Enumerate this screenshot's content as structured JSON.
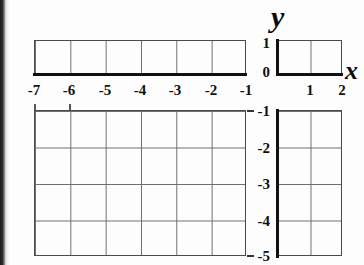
{
  "figure": {
    "kind": "coordinate-grid"
  },
  "axes": {
    "x_name": "x",
    "y_name": "y"
  },
  "chart_data": {
    "type": "scatter",
    "title": "",
    "subtitle": "",
    "xlabel": "x",
    "ylabel": "y",
    "xlim": [
      -7,
      2
    ],
    "ylim": [
      -5,
      1
    ],
    "xticks": [
      -7,
      -6,
      -5,
      -4,
      -3,
      -2,
      -1,
      1,
      2
    ],
    "yticks": [
      1,
      0,
      -1,
      -2,
      -3,
      -4,
      -5
    ],
    "xtick_labels": [
      "-7",
      "-6",
      "-5",
      "-4",
      "-3",
      "-2",
      "-1",
      "1",
      "2"
    ],
    "ytick_labels": [
      "1",
      "0",
      "-1",
      "-2",
      "-3",
      "-4",
      "-5"
    ],
    "grid": true,
    "grid_spacing": 1,
    "legend": false,
    "legend_position": "none",
    "series": [],
    "values": [],
    "x": [],
    "categories": [],
    "annotations": [],
    "axis_color": "#111111",
    "grid_color": "#6e6e6e",
    "background": "#fdfdfd",
    "note": "Empty grid — no data plotted; axes drawn as heavy black lines through x=0 and y=0"
  },
  "xticks": [
    {
      "label": "-7",
      "left": 19
    },
    {
      "label": "-6",
      "left": 54
    },
    {
      "label": "-5",
      "left": 90
    },
    {
      "label": "-4",
      "left": 125
    },
    {
      "label": "-3",
      "left": 160
    },
    {
      "label": "-2",
      "left": 196
    },
    {
      "label": "-1",
      "left": 231
    },
    {
      "label": "1",
      "left": 295
    },
    {
      "label": "2",
      "left": 327
    }
  ],
  "yticks": [
    {
      "label": "1",
      "top": 36
    },
    {
      "label": "0",
      "top": 65
    },
    {
      "label": "-1",
      "top": 104
    },
    {
      "label": "-2",
      "top": 141
    },
    {
      "label": "-3",
      "top": 177
    },
    {
      "label": "-4",
      "top": 214
    },
    {
      "label": "-5",
      "top": 249
    }
  ]
}
